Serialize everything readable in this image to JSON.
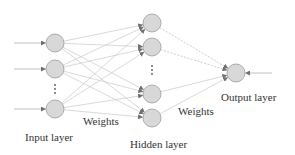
{
  "diagram": {
    "type": "neural-network",
    "labels": {
      "input_layer": "Input layer",
      "hidden_layer": "Hidden layer",
      "output_layer": "Output layer",
      "weights_input_hidden": "Weights",
      "weights_hidden_output": "Weights"
    },
    "layers": {
      "input": {
        "visible_nodes": 3,
        "ellipsis_after": 2
      },
      "hidden": {
        "visible_nodes": 4,
        "ellipsis_after": 2
      },
      "output": {
        "visible_nodes": 1
      }
    },
    "connections": "fully-connected",
    "colors": {
      "node_fill": "#d8d8d8",
      "node_stroke": "#9a9a9a",
      "edge": "#c8c8c8",
      "text": "#333333",
      "arrowhead": "#707070"
    }
  }
}
